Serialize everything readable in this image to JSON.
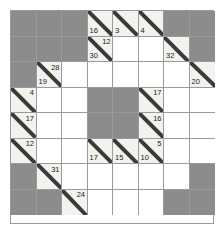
{
  "puzzle": {
    "type": "kakuro-grid",
    "rows": 8,
    "cols": 8,
    "cell_size": 25.5,
    "colors": {
      "block": "#8c8c8c",
      "clue": "#f2f2ee",
      "blank": "#ffffff",
      "grid_line": "#9a9a9a",
      "diagonal_line": "#3a3a3a",
      "text": "#1a1a1a",
      "page_background": "#ffffff"
    },
    "legend": {
      "block_label": "blocked cell",
      "clue_label": "clue cell with diagonal",
      "blank_label": "empty entry cell"
    },
    "cells": [
      {
        "r": 1,
        "c": 1,
        "kind": "block"
      },
      {
        "r": 1,
        "c": 2,
        "kind": "block"
      },
      {
        "r": 1,
        "c": 3,
        "kind": "block"
      },
      {
        "r": 1,
        "c": 4,
        "kind": "clue",
        "lower": "16",
        "upper": ""
      },
      {
        "r": 1,
        "c": 5,
        "kind": "clue",
        "lower": "3",
        "upper": ""
      },
      {
        "r": 1,
        "c": 6,
        "kind": "clue",
        "lower": "4",
        "upper": ""
      },
      {
        "r": 1,
        "c": 7,
        "kind": "block"
      },
      {
        "r": 1,
        "c": 8,
        "kind": "block"
      },
      {
        "r": 2,
        "c": 1,
        "kind": "block"
      },
      {
        "r": 2,
        "c": 2,
        "kind": "block"
      },
      {
        "r": 2,
        "c": 3,
        "kind": "block"
      },
      {
        "r": 2,
        "c": 4,
        "kind": "clue",
        "lower": "30",
        "upper": "12"
      },
      {
        "r": 2,
        "c": 5,
        "kind": "blank"
      },
      {
        "r": 2,
        "c": 6,
        "kind": "blank"
      },
      {
        "r": 2,
        "c": 7,
        "kind": "clue",
        "lower": "32",
        "upper": ""
      },
      {
        "r": 2,
        "c": 8,
        "kind": "block"
      },
      {
        "r": 3,
        "c": 1,
        "kind": "block"
      },
      {
        "r": 3,
        "c": 2,
        "kind": "clue",
        "lower": "19",
        "upper": "28"
      },
      {
        "r": 3,
        "c": 3,
        "kind": "blank"
      },
      {
        "r": 3,
        "c": 4,
        "kind": "blank"
      },
      {
        "r": 3,
        "c": 5,
        "kind": "blank"
      },
      {
        "r": 3,
        "c": 6,
        "kind": "blank"
      },
      {
        "r": 3,
        "c": 7,
        "kind": "blank"
      },
      {
        "r": 3,
        "c": 8,
        "kind": "clue",
        "lower": "20",
        "upper": ""
      },
      {
        "r": 4,
        "c": 1,
        "kind": "clue",
        "lower": "",
        "upper": "4"
      },
      {
        "r": 4,
        "c": 2,
        "kind": "blank"
      },
      {
        "r": 4,
        "c": 3,
        "kind": "blank"
      },
      {
        "r": 4,
        "c": 4,
        "kind": "block"
      },
      {
        "r": 4,
        "c": 5,
        "kind": "block"
      },
      {
        "r": 4,
        "c": 6,
        "kind": "clue",
        "lower": "",
        "upper": "17"
      },
      {
        "r": 4,
        "c": 7,
        "kind": "blank"
      },
      {
        "r": 4,
        "c": 8,
        "kind": "blank"
      },
      {
        "r": 5,
        "c": 1,
        "kind": "clue",
        "lower": "",
        "upper": "17"
      },
      {
        "r": 5,
        "c": 2,
        "kind": "blank"
      },
      {
        "r": 5,
        "c": 3,
        "kind": "blank"
      },
      {
        "r": 5,
        "c": 4,
        "kind": "block"
      },
      {
        "r": 5,
        "c": 5,
        "kind": "block"
      },
      {
        "r": 5,
        "c": 6,
        "kind": "clue",
        "lower": "",
        "upper": "16"
      },
      {
        "r": 5,
        "c": 7,
        "kind": "blank"
      },
      {
        "r": 5,
        "c": 8,
        "kind": "blank"
      },
      {
        "r": 6,
        "c": 1,
        "kind": "clue",
        "lower": "",
        "upper": "12"
      },
      {
        "r": 6,
        "c": 2,
        "kind": "blank"
      },
      {
        "r": 6,
        "c": 3,
        "kind": "blank"
      },
      {
        "r": 6,
        "c": 4,
        "kind": "clue",
        "lower": "17",
        "upper": ""
      },
      {
        "r": 6,
        "c": 5,
        "kind": "clue",
        "lower": "15",
        "upper": ""
      },
      {
        "r": 6,
        "c": 6,
        "kind": "clue",
        "lower": "10",
        "upper": "5"
      },
      {
        "r": 6,
        "c": 7,
        "kind": "blank"
      },
      {
        "r": 6,
        "c": 8,
        "kind": "blank"
      },
      {
        "r": 7,
        "c": 1,
        "kind": "block"
      },
      {
        "r": 7,
        "c": 2,
        "kind": "clue",
        "lower": "",
        "upper": "31"
      },
      {
        "r": 7,
        "c": 3,
        "kind": "blank"
      },
      {
        "r": 7,
        "c": 4,
        "kind": "blank"
      },
      {
        "r": 7,
        "c": 5,
        "kind": "blank"
      },
      {
        "r": 7,
        "c": 6,
        "kind": "blank"
      },
      {
        "r": 7,
        "c": 7,
        "kind": "blank"
      },
      {
        "r": 7,
        "c": 8,
        "kind": "block"
      },
      {
        "r": 8,
        "c": 1,
        "kind": "block"
      },
      {
        "r": 8,
        "c": 2,
        "kind": "block"
      },
      {
        "r": 8,
        "c": 3,
        "kind": "clue",
        "lower": "",
        "upper": "24"
      },
      {
        "r": 8,
        "c": 4,
        "kind": "blank"
      },
      {
        "r": 8,
        "c": 5,
        "kind": "blank"
      },
      {
        "r": 8,
        "c": 6,
        "kind": "blank"
      },
      {
        "r": 8,
        "c": 7,
        "kind": "block"
      },
      {
        "r": 8,
        "c": 8,
        "kind": "block"
      }
    ]
  }
}
